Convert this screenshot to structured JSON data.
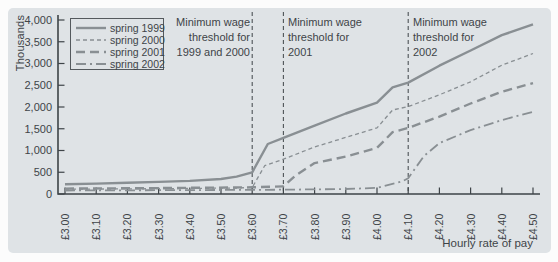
{
  "figure": {
    "background": "#fcfcfc",
    "panel_color": "#dfe3e6",
    "axis_color": "#3e4448",
    "text_color": "#3e4448",
    "series_color": "#898f93",
    "threshold_line_color": "#4d5357"
  },
  "chart_data": {
    "type": "line",
    "title": "",
    "ylabel": "Thousands",
    "xlabel": "Hourly rate of pay",
    "ylim": [
      0,
      4000
    ],
    "xlim": [
      3.0,
      4.5
    ],
    "grid": false,
    "legend_position": "top-left",
    "y_ticks": [
      0,
      500,
      1000,
      1500,
      2000,
      2500,
      3000,
      3500,
      4000
    ],
    "y_tick_labels": [
      "0",
      "500",
      "1,000",
      "1,500",
      "2,000",
      "2,500",
      "3,000",
      "3,500",
      "4,000"
    ],
    "x_ticks": [
      3.0,
      3.1,
      3.2,
      3.3,
      3.4,
      3.5,
      3.6,
      3.7,
      3.8,
      3.9,
      4.0,
      4.1,
      4.2,
      4.3,
      4.4,
      4.5
    ],
    "x_tick_labels": [
      "£3.00",
      "£3.10",
      "£3.20",
      "£3.30",
      "£3.40",
      "£3.50",
      "£3.60",
      "£3.70",
      "£3.80",
      "£3.90",
      "£4.00",
      "£4.10",
      "£4.20",
      "£4.30",
      "£4.40",
      "£4.50"
    ],
    "series": [
      {
        "name": "spring 1999",
        "style": "solid",
        "points": [
          [
            3.0,
            225
          ],
          [
            3.1,
            240
          ],
          [
            3.2,
            258
          ],
          [
            3.3,
            278
          ],
          [
            3.4,
            300
          ],
          [
            3.5,
            345
          ],
          [
            3.55,
            400
          ],
          [
            3.6,
            500
          ],
          [
            3.65,
            1150
          ],
          [
            3.7,
            1290
          ],
          [
            3.8,
            1570
          ],
          [
            3.9,
            1850
          ],
          [
            4.0,
            2100
          ],
          [
            4.05,
            2450
          ],
          [
            4.1,
            2560
          ],
          [
            4.2,
            2950
          ],
          [
            4.3,
            3300
          ],
          [
            4.4,
            3650
          ],
          [
            4.5,
            3900
          ]
        ]
      },
      {
        "name": "spring 2000",
        "style": "dashed-fine",
        "points": [
          [
            3.0,
            110
          ],
          [
            3.2,
            118
          ],
          [
            3.4,
            128
          ],
          [
            3.55,
            138
          ],
          [
            3.6,
            150
          ],
          [
            3.64,
            650
          ],
          [
            3.7,
            800
          ],
          [
            3.8,
            1080
          ],
          [
            3.9,
            1300
          ],
          [
            4.0,
            1520
          ],
          [
            4.05,
            1930
          ],
          [
            4.1,
            2010
          ],
          [
            4.2,
            2280
          ],
          [
            4.3,
            2580
          ],
          [
            4.4,
            2960
          ],
          [
            4.5,
            3230
          ]
        ]
      },
      {
        "name": "spring 2001",
        "style": "dashed-long",
        "points": [
          [
            3.0,
            125
          ],
          [
            3.3,
            135
          ],
          [
            3.6,
            155
          ],
          [
            3.7,
            175
          ],
          [
            3.74,
            430
          ],
          [
            3.8,
            710
          ],
          [
            3.9,
            860
          ],
          [
            4.0,
            1060
          ],
          [
            4.05,
            1420
          ],
          [
            4.1,
            1520
          ],
          [
            4.2,
            1780
          ],
          [
            4.3,
            2080
          ],
          [
            4.4,
            2350
          ],
          [
            4.5,
            2550
          ]
        ]
      },
      {
        "name": "spring 2002",
        "style": "dash-dot",
        "points": [
          [
            3.0,
            80
          ],
          [
            3.4,
            90
          ],
          [
            3.7,
            100
          ],
          [
            3.9,
            115
          ],
          [
            4.0,
            140
          ],
          [
            4.08,
            290
          ],
          [
            4.1,
            360
          ],
          [
            4.15,
            870
          ],
          [
            4.2,
            1170
          ],
          [
            4.3,
            1470
          ],
          [
            4.4,
            1700
          ],
          [
            4.5,
            1890
          ]
        ]
      }
    ],
    "annotations": [
      {
        "text": "Minimum wage\nthreshold for\n1999 and 2000",
        "x": 3.6,
        "align": "right"
      },
      {
        "text": "Minimum wage\nthreshold for\n2001",
        "x": 3.7,
        "align": "left"
      },
      {
        "text": "Minimum wage\nthreshold for\n2002",
        "x": 4.1,
        "align": "left"
      }
    ]
  }
}
